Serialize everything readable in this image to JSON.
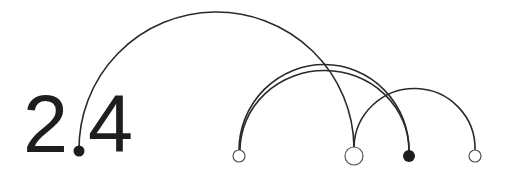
{
  "logo": {
    "version_text": {
      "major": "2",
      "minor": "4"
    },
    "stroke_color": "#2a2a2a",
    "fill_color": "#1e1e1e",
    "nodes": [
      {
        "id": "decimal-point",
        "x": 79,
        "y": 151,
        "r": 5.5,
        "filled": true
      },
      {
        "id": "node-a",
        "x": 239,
        "y": 156,
        "r": 6,
        "filled": false
      },
      {
        "id": "node-b",
        "x": 354,
        "y": 156,
        "r": 9,
        "filled": false
      },
      {
        "id": "node-c",
        "x": 409,
        "y": 156,
        "r": 6,
        "filled": true
      },
      {
        "id": "node-d",
        "x": 475,
        "y": 156,
        "r": 6,
        "filled": false
      }
    ],
    "arcs": [
      {
        "from": "decimal-point",
        "to": "node-b",
        "peak_y": 14
      },
      {
        "from": "node-a",
        "to": "node-c",
        "peak_y": 64
      },
      {
        "from": "node-a",
        "to": "node-c",
        "peak_y": 70
      },
      {
        "from": "node-b",
        "to": "node-d",
        "peak_y": 89
      }
    ]
  }
}
